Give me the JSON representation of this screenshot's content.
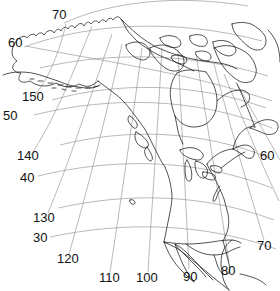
{
  "figure": {
    "kind": "map",
    "region": "North America",
    "projection": "lambert-conformal-conic",
    "background_color": "#ffffff",
    "coastline_color": "#1a1a1a",
    "graticule_color": "#8a8a8a"
  },
  "graticule": {
    "latitude_label_values": [
      "70",
      "60",
      "50",
      "40",
      "30"
    ],
    "longitude_label_values": [
      "150",
      "140",
      "130",
      "120",
      "110",
      "100",
      "90",
      "80",
      "70",
      "60"
    ],
    "labels": [
      {
        "name": "lat-70-top",
        "text": "70",
        "type": "latitude",
        "x": 52,
        "y": 8
      },
      {
        "name": "lat-60-left",
        "text": "60",
        "type": "latitude",
        "x": 8,
        "y": 36
      },
      {
        "name": "lon-150",
        "text": "150",
        "type": "longitude",
        "x": 22,
        "y": 90
      },
      {
        "name": "lat-50-left",
        "text": "50",
        "type": "latitude",
        "x": 3,
        "y": 109
      },
      {
        "name": "lon-140",
        "text": "140",
        "type": "longitude",
        "x": 17,
        "y": 149
      },
      {
        "name": "lat-40-left",
        "text": "40",
        "type": "latitude",
        "x": 20,
        "y": 171
      },
      {
        "name": "lat-60-right",
        "text": "60",
        "type": "latitude",
        "x": 260,
        "y": 149
      },
      {
        "name": "lon-130",
        "text": "130",
        "type": "longitude",
        "x": 33,
        "y": 211
      },
      {
        "name": "lat-30-left",
        "text": "30",
        "type": "latitude",
        "x": 33,
        "y": 231
      },
      {
        "name": "lat-70-right",
        "text": "70",
        "type": "latitude",
        "x": 257,
        "y": 239
      },
      {
        "name": "lon-120",
        "text": "120",
        "type": "longitude",
        "x": 57,
        "y": 252
      },
      {
        "name": "lon-80",
        "text": "80",
        "type": "longitude",
        "x": 221,
        "y": 264
      },
      {
        "name": "lon-110",
        "text": "110",
        "type": "longitude",
        "x": 99,
        "y": 271
      },
      {
        "name": "lon-100",
        "text": "100",
        "type": "longitude",
        "x": 136,
        "y": 271
      },
      {
        "name": "lon-90",
        "text": "90",
        "type": "longitude",
        "x": 183,
        "y": 270
      }
    ]
  }
}
